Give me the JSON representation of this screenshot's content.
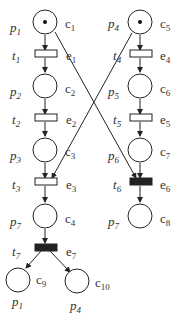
{
  "diagram": {
    "type": "petri-net-branching-process",
    "places": [
      {
        "id": "c1",
        "label": "p1",
        "cond": "c1",
        "x": 45,
        "y": 22,
        "token": true
      },
      {
        "id": "c2",
        "label": "p2",
        "cond": "c2",
        "x": 45,
        "y": 86,
        "token": false
      },
      {
        "id": "c3",
        "label": "p3",
        "cond": "c3",
        "x": 45,
        "y": 150,
        "token": false
      },
      {
        "id": "c4",
        "label": "p7",
        "cond": "c4",
        "x": 45,
        "y": 216,
        "token": false
      },
      {
        "id": "c9",
        "label": "p1",
        "cond": "c9",
        "x": 16,
        "y": 276,
        "token": false
      },
      {
        "id": "c10",
        "label": "p4",
        "cond": "c10",
        "x": 77,
        "y": 280,
        "token": false
      },
      {
        "id": "c5",
        "label": "p4",
        "cond": "c5",
        "x": 140,
        "y": 22,
        "token": true
      },
      {
        "id": "c6",
        "label": "p5",
        "cond": "c6",
        "x": 140,
        "y": 86,
        "token": false
      },
      {
        "id": "c7",
        "label": "p6",
        "cond": "c7",
        "x": 140,
        "y": 150,
        "token": false
      },
      {
        "id": "c8",
        "label": "p7",
        "cond": "c8",
        "x": 140,
        "y": 216,
        "token": false
      }
    ],
    "transitions": [
      {
        "id": "e1",
        "label": "t1",
        "event": "e1",
        "x": 45,
        "y": 54,
        "filled": false
      },
      {
        "id": "e2",
        "label": "t2",
        "event": "e2",
        "x": 45,
        "y": 118,
        "filled": false
      },
      {
        "id": "e3",
        "label": "t3",
        "event": "e3",
        "x": 45,
        "y": 182,
        "filled": false
      },
      {
        "id": "e7",
        "label": "t7",
        "event": "e7",
        "x": 45,
        "y": 247,
        "filled": true
      },
      {
        "id": "e4",
        "label": "t4",
        "event": "e4",
        "x": 140,
        "y": 54,
        "filled": false
      },
      {
        "id": "e5",
        "label": "t5",
        "event": "e5",
        "x": 140,
        "y": 118,
        "filled": false
      },
      {
        "id": "e6",
        "label": "t6",
        "event": "e6",
        "x": 140,
        "y": 182,
        "filled": true
      }
    ]
  }
}
